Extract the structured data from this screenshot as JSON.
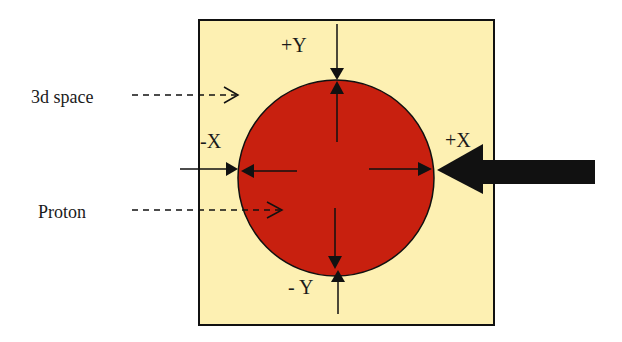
{
  "diagram": {
    "labels": {
      "space": "3d space",
      "proton": "Proton",
      "plus_y": "+Y",
      "minus_y": "- Y",
      "plus_x": "+X",
      "minus_x": "-X"
    },
    "colors": {
      "space_fill": "#fdf0b2",
      "proton_fill": "#c8200f",
      "stroke": "#111111",
      "background": "#ffffff"
    }
  }
}
